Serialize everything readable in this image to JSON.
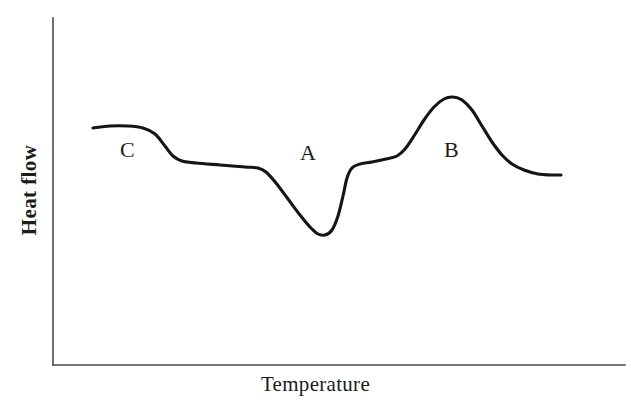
{
  "figure": {
    "width": 631,
    "height": 409,
    "background": "#ffffff",
    "curve_color": "#151515",
    "axis_color": "#4b4b4b",
    "text_color": "#1c1c1c"
  },
  "chart_data": {
    "type": "line",
    "title": "",
    "subtitle": "",
    "xlabel": "Temperature",
    "ylabel": "Heat flow",
    "grid": false,
    "legend": null,
    "axis": {
      "x_ticks": [],
      "y_ticks": [],
      "x_tick_labels": [],
      "y_tick_labels": [],
      "xlim_label": "",
      "ylim_label": "",
      "x_axis_pixel_span": [
        53,
        625
      ],
      "y_axis_pixel_span": [
        18,
        365
      ],
      "description": "Unlabeled qualitative axes; no numeric tick marks are drawn."
    },
    "annotations": [
      {
        "label": "C",
        "meaning": "glass-transition step (baseline shift)",
        "x_px": 128,
        "y_px": 150
      },
      {
        "label": "A",
        "meaning": "endothermic melting minimum",
        "x_px": 308,
        "y_px": 153
      },
      {
        "label": "B",
        "meaning": "exothermic crystallisation maximum",
        "x_px": 452,
        "y_px": 150
      }
    ],
    "series": [
      {
        "name": "Heat flow trace",
        "color": "#151515",
        "points_px": [
          [
            93,
            128
          ],
          [
            110,
            126
          ],
          [
            128,
            126
          ],
          [
            143,
            128
          ],
          [
            155,
            134
          ],
          [
            165,
            146
          ],
          [
            173,
            156
          ],
          [
            182,
            161
          ],
          [
            196,
            163
          ],
          [
            220,
            165
          ],
          [
            245,
            167
          ],
          [
            258,
            168
          ],
          [
            266,
            172
          ],
          [
            276,
            183
          ],
          [
            288,
            199
          ],
          [
            300,
            215
          ],
          [
            310,
            227
          ],
          [
            318,
            234
          ],
          [
            325,
            235
          ],
          [
            332,
            230
          ],
          [
            338,
            216
          ],
          [
            343,
            196
          ],
          [
            347,
            178
          ],
          [
            352,
            168
          ],
          [
            360,
            164
          ],
          [
            372,
            162
          ],
          [
            386,
            159
          ],
          [
            397,
            156
          ],
          [
            405,
            149
          ],
          [
            414,
            136
          ],
          [
            424,
            120
          ],
          [
            434,
            107
          ],
          [
            444,
            99
          ],
          [
            453,
            97
          ],
          [
            462,
            100
          ],
          [
            472,
            110
          ],
          [
            482,
            126
          ],
          [
            492,
            142
          ],
          [
            502,
            155
          ],
          [
            512,
            164
          ],
          [
            524,
            170
          ],
          [
            538,
            174
          ],
          [
            550,
            175
          ],
          [
            561,
            175
          ]
        ]
      }
    ]
  }
}
